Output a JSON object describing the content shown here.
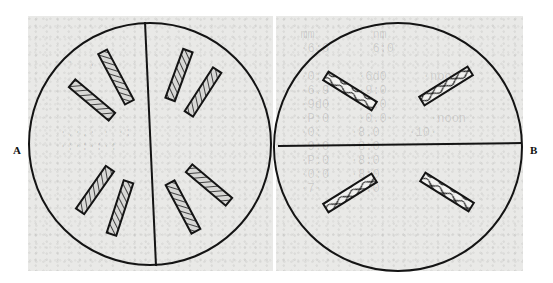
{
  "figure": {
    "panels": [
      {
        "id": "A",
        "label": "A",
        "circle": {
          "cx": 150,
          "cy": 144,
          "r": 121
        },
        "divider": {
          "orientation": "vertical",
          "x1": 145,
          "y1": 22,
          "x2": 156,
          "y2": 266
        },
        "crystal_count": 8,
        "crystals": [
          {
            "cx": 92,
            "cy": 100,
            "len": 52,
            "w": 10,
            "angle": 40
          },
          {
            "cx": 116,
            "cy": 77,
            "len": 57,
            "w": 10,
            "angle": 62
          },
          {
            "cx": 179,
            "cy": 75,
            "len": 52,
            "w": 10,
            "angle": -70
          },
          {
            "cx": 203,
            "cy": 92,
            "len": 52,
            "w": 10,
            "angle": -57
          },
          {
            "cx": 95,
            "cy": 190,
            "len": 52,
            "w": 10,
            "angle": -55
          },
          {
            "cx": 120,
            "cy": 208,
            "len": 55,
            "w": 10,
            "angle": -72
          },
          {
            "cx": 183,
            "cy": 207,
            "len": 55,
            "w": 10,
            "angle": 62
          },
          {
            "cx": 209,
            "cy": 185,
            "len": 52,
            "w": 10,
            "angle": 40
          }
        ]
      },
      {
        "id": "B",
        "label": "B",
        "circle": {
          "cx": 398,
          "cy": 147,
          "r": 124
        },
        "divider": {
          "orientation": "horizontal",
          "x1": 278,
          "y1": 146,
          "x2": 522,
          "y2": 143
        },
        "crystal_count": 4,
        "crystals": [
          {
            "cx": 350,
            "cy": 91,
            "len": 57,
            "w": 10,
            "angle": 32
          },
          {
            "cx": 446,
            "cy": 86,
            "len": 57,
            "w": 10,
            "angle": -32
          },
          {
            "cx": 350,
            "cy": 193,
            "len": 57,
            "w": 10,
            "angle": -32
          },
          {
            "cx": 447,
            "cy": 192,
            "len": 57,
            "w": 10,
            "angle": 32
          }
        ]
      }
    ],
    "colors": {
      "background": "#ffffff",
      "panel_fill": "#e9e9e7",
      "line": "#141414",
      "crystal_fill": "#d8d8d6"
    },
    "ghost_text": {
      "a": "  · ·  .\n\n\n\n\n   ·.·.· · ·:\n   ·:·:·:·:\n",
      "b": "  mm        nm\n  ·6:0      6:0\n\n  ·0:     ·6d0     ·noon\n  ·6.9    ·9:0\n  ·9d0    ·0.0\n  ·P:0    ·0.0·     ·noon\n  ·0:    ·8.0    ·10·\n  ·9:0   ·8:0\n  ·P:0   ·8:0\n  ·0:0   ·8:0\n  ·7·    ·0:0\n"
    }
  }
}
